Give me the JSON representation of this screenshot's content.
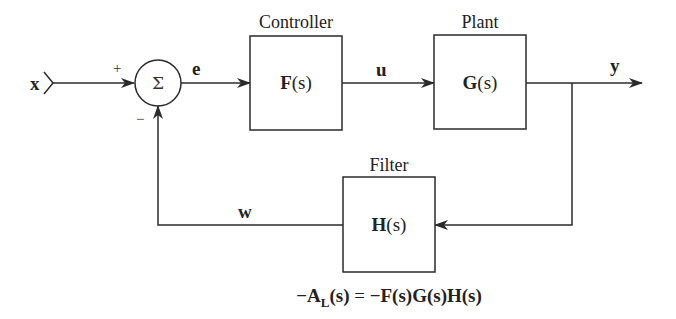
{
  "diagram": {
    "type": "feedback-block-diagram",
    "input_signal": "x",
    "summing_junction": {
      "symbol": "Σ",
      "plus_sign": "+",
      "minus_sign": "−"
    },
    "signals": {
      "error": "e",
      "control": "u",
      "output": "y",
      "feedback": "w"
    },
    "blocks": {
      "controller": {
        "title": "Controller",
        "func": "F",
        "arg": "(s)"
      },
      "plant": {
        "title": "Plant",
        "func": "G",
        "arg": "(s)"
      },
      "filter": {
        "title": "Filter",
        "func": "H",
        "arg": "(s)"
      }
    },
    "equation": {
      "lhs_prefix": "−A",
      "lhs_sub": "L",
      "lhs_arg": "(s)",
      "eq": " = ",
      "rhs": "−F(s)G(s)H(s)"
    },
    "colors": {
      "stroke": "#2b2b2b",
      "text": "#222222",
      "background": "#ffffff"
    }
  }
}
